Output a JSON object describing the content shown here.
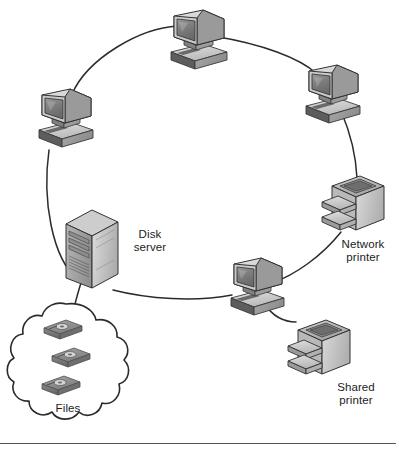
{
  "figure": {
    "topology": "ring",
    "background_color": "#ffffff",
    "line_color": "#2b2b2b",
    "label_color": "#1c1c1c",
    "divider_color": "#555555"
  },
  "labels": {
    "disk_server": "Disk\nserver",
    "network_printer": "Network\nprinter",
    "shared_printer": "Shared\nprinter",
    "files": "Files"
  },
  "nodes": [
    {
      "id": "workstation-top",
      "icon": "desktop-computer-icon",
      "label": "",
      "x": 195,
      "y": 42
    },
    {
      "id": "workstation-left",
      "icon": "desktop-computer-icon",
      "label": "",
      "x": 63,
      "y": 118
    },
    {
      "id": "workstation-right",
      "icon": "desktop-computer-icon",
      "label": "",
      "x": 330,
      "y": 95
    },
    {
      "id": "workstation-bottom",
      "icon": "desktop-computer-icon",
      "label": "",
      "x": 256,
      "y": 288
    },
    {
      "id": "disk-server",
      "icon": "tower-server-icon",
      "label": "Disk\nserver",
      "x": 90,
      "y": 243
    },
    {
      "id": "network-printer",
      "icon": "printer-icon",
      "label": "Network\nprinter",
      "x": 356,
      "y": 202
    },
    {
      "id": "shared-printer",
      "icon": "printer-icon",
      "label": "Shared\nprinter",
      "x": 322,
      "y": 347
    },
    {
      "id": "files-cloud",
      "icon": "cloud-storage-icon",
      "label": "Files",
      "x": 68,
      "y": 360
    }
  ],
  "connections": [
    {
      "from": "workstation-left",
      "to": "workstation-top",
      "type": "ring-segment"
    },
    {
      "from": "workstation-top",
      "to": "workstation-right",
      "type": "ring-segment"
    },
    {
      "from": "workstation-right",
      "to": "network-printer",
      "type": "ring-segment"
    },
    {
      "from": "network-printer",
      "to": "workstation-bottom",
      "type": "ring-segment"
    },
    {
      "from": "workstation-bottom",
      "to": "disk-server",
      "type": "ring-segment"
    },
    {
      "from": "disk-server",
      "to": "workstation-left",
      "type": "ring-segment"
    },
    {
      "from": "disk-server",
      "to": "files-cloud",
      "type": "spur"
    },
    {
      "from": "workstation-bottom",
      "to": "shared-printer",
      "type": "spur"
    }
  ],
  "cloud_contents": {
    "icon": "disk-media-icon",
    "count": 3
  }
}
